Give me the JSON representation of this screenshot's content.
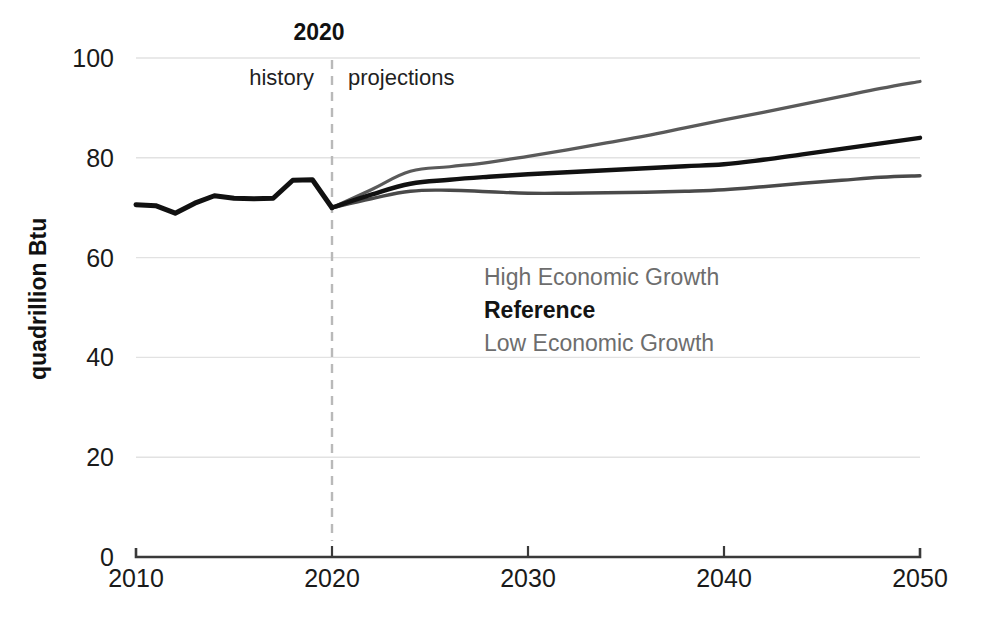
{
  "chart_data": {
    "type": "line",
    "title": "",
    "subtitle": "",
    "xlabel": "",
    "ylabel": "quadrillion Btu",
    "xlim": [
      2010,
      2050
    ],
    "ylim": [
      0,
      100
    ],
    "ytick_labels": [
      "0",
      "20",
      "40",
      "60",
      "80",
      "100"
    ],
    "ytick_values": [
      0,
      20,
      40,
      60,
      80,
      100
    ],
    "xtick_labels": [
      "2010",
      "2020",
      "2030",
      "2040",
      "2050"
    ],
    "xtick_values": [
      2010,
      2020,
      2030,
      2040,
      2050
    ],
    "grid": "horizontal",
    "legend_position": "inside-center",
    "annotations": {
      "divider_year": "2020",
      "history_label": "history",
      "projections_label": "projections"
    },
    "colors": {
      "high_growth": "#5a5a5a",
      "reference": "#111111",
      "low_growth": "#4a4a4a",
      "gridline": "#e2e2e2",
      "axis": "#3a3a3a",
      "divider": "#b9b9b9",
      "legend_muted": "#6d6d6d"
    },
    "history": {
      "name": "history",
      "x": [
        2010,
        2011,
        2012,
        2013,
        2014,
        2015,
        2016,
        2017,
        2018,
        2019,
        2020
      ],
      "values": [
        70.6,
        70.4,
        68.9,
        70.9,
        72.4,
        71.9,
        71.8,
        71.9,
        75.5,
        75.6,
        70.0
      ]
    },
    "series": [
      {
        "name": "High Economic Growth",
        "x": [
          2020,
          2022,
          2024,
          2026,
          2028,
          2030,
          2032,
          2034,
          2036,
          2038,
          2040,
          2042,
          2044,
          2046,
          2048,
          2050
        ],
        "values": [
          70.0,
          73.6,
          77.3,
          78.2,
          79.1,
          80.3,
          81.6,
          83.0,
          84.4,
          86.0,
          87.6,
          89.1,
          90.7,
          92.3,
          93.9,
          95.3
        ]
      },
      {
        "name": "Reference",
        "x": [
          2020,
          2022,
          2024,
          2026,
          2028,
          2030,
          2032,
          2034,
          2036,
          2038,
          2040,
          2042,
          2044,
          2046,
          2048,
          2050
        ],
        "values": [
          70.0,
          72.6,
          74.8,
          75.6,
          76.2,
          76.7,
          77.1,
          77.5,
          77.9,
          78.3,
          78.7,
          79.6,
          80.7,
          81.8,
          82.9,
          84.0
        ]
      },
      {
        "name": "Low Economic Growth",
        "x": [
          2020,
          2022,
          2024,
          2026,
          2028,
          2030,
          2032,
          2034,
          2036,
          2038,
          2040,
          2042,
          2044,
          2046,
          2048,
          2050
        ],
        "values": [
          70.0,
          71.8,
          73.3,
          73.5,
          73.2,
          72.9,
          72.9,
          73.0,
          73.1,
          73.3,
          73.6,
          74.2,
          74.9,
          75.5,
          76.1,
          76.4
        ]
      }
    ],
    "legend": [
      {
        "label": "High Economic Growth",
        "emphasis": "muted"
      },
      {
        "label": "Reference",
        "emphasis": "strong"
      },
      {
        "label": "Low Economic Growth",
        "emphasis": "muted"
      }
    ]
  }
}
